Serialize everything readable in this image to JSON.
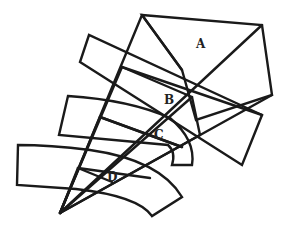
{
  "diagram": {
    "width": 288,
    "height": 228,
    "stroke_color": "#1a1a1a",
    "background": "#ffffff",
    "apex": [
      60,
      213
    ],
    "labels": [
      {
        "id": "A",
        "text": "A",
        "x": 196,
        "y": 48
      },
      {
        "id": "B",
        "text": "B",
        "x": 164,
        "y": 104
      },
      {
        "id": "C",
        "text": "C",
        "x": 154,
        "y": 139
      },
      {
        "id": "D",
        "text": "D",
        "x": 107,
        "y": 181
      }
    ],
    "regions": {
      "A": {
        "outline": "M142,15 L262,25 L272,95 L196,120 L182,70 Z",
        "diagonal": "M142,15 L182,70"
      },
      "B_strip": {
        "outline": "M89,35 L80,62 L242,165 L262,115 Z"
      },
      "B_inner": {
        "outline": "M122,67 L192,97 L200,135"
      },
      "C_strip": {
        "outline": "M68,96 L59,135 L168,145 Q176,152 172,165 L192,165 Q196,140 170,118 Q130,100 68,96 Z"
      },
      "C_inner": {
        "outline": "M100,117 L182,147"
      },
      "D_strip": {
        "outline": "M18,145 L17,185 L76,189 Q138,196 152,216 L182,197 Q160,160 90,150 Q50,145 18,145 Z"
      },
      "D_inner": {
        "outline": "M78,168 L112,182"
      }
    },
    "rays": [
      "M60,213 L142,15",
      "M60,213 L262,25",
      "M60,213 L272,95",
      "M60,213 L200,135",
      "M60,213 L192,97",
      "M60,213 L122,67",
      "M60,213 L100,117",
      "M60,213 L78,168"
    ],
    "cross_lines": [
      "M100,117 L182,147",
      "M78,168 L150,178",
      "M122,67 L262,115"
    ]
  }
}
